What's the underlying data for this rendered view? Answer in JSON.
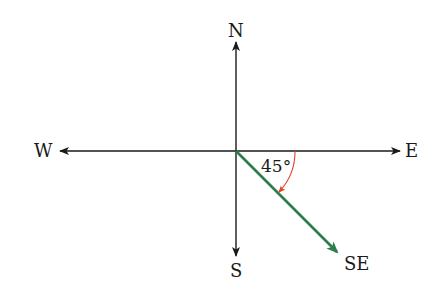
{
  "diagram": {
    "type": "compass-direction",
    "labels": {
      "north": "N",
      "south": "S",
      "east": "E",
      "west": "W",
      "southeast": "SE"
    },
    "angle": {
      "value": "45°",
      "from": "E",
      "to": "SE"
    },
    "colors": {
      "axes": "#1a1a1a",
      "southeast_vector": "#2e7d4f",
      "angle_arc": "#e0452a"
    }
  }
}
